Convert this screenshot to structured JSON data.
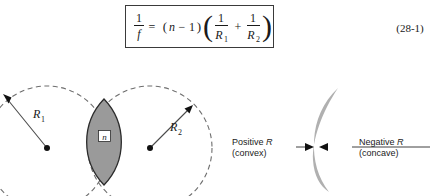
{
  "figure": {
    "equation": {
      "number": "(28-1)",
      "lhs_numerator": "1",
      "lhs_denominator": "f",
      "equals": "=",
      "factor_open": "(",
      "factor_n": "n",
      "factor_minus": "−",
      "factor_one": "1",
      "factor_close": ")",
      "group_open": "(",
      "term1_numerator": "1",
      "term1_denominator": "R",
      "term1_subscript": "1",
      "plus": "+",
      "term2_numerator": "1",
      "term2_denominator": "R",
      "term2_subscript": "2",
      "group_close": ")"
    },
    "left_diagram": {
      "radius1_label": "R",
      "radius1_subscript": "1",
      "radius2_label": "R",
      "radius2_subscript": "2",
      "index_label": "n"
    },
    "right_diagram": {
      "positive_line1_prefix": "Positive ",
      "positive_line1_symbol": "R",
      "positive_line2": "(convex)",
      "negative_line1_prefix": "Negative ",
      "negative_line1_symbol": "R",
      "negative_line2": "(concave)"
    },
    "colors": {
      "lens_fill": "#9a9a9a",
      "meniscus_fill": "#b0b0b0",
      "dashed_stroke": "#6e6e6e",
      "outline": "#2b2b2b",
      "text": "#1a1a1a",
      "background": "#ffffff"
    }
  }
}
